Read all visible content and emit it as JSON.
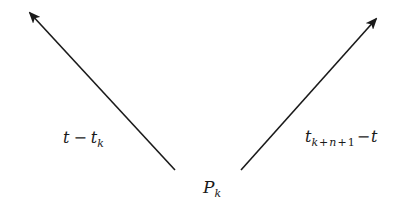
{
  "diagram": {
    "type": "vector-diagram",
    "colors": {
      "background": "#ffffff",
      "stroke": "#1a1a1a"
    },
    "arrows": [
      {
        "id": "left-arrow",
        "from": [
          175,
          170
        ],
        "to": [
          28,
          11
        ],
        "label": {
          "main": "t",
          "operator": "−",
          "second": "t",
          "second_sub": "k"
        }
      },
      {
        "id": "right-arrow",
        "from": [
          241,
          170
        ],
        "to": [
          378,
          17
        ],
        "label": {
          "main": "t",
          "main_sub_parts": [
            "k",
            "+",
            "n",
            "+",
            "1"
          ],
          "operator": "−",
          "second": "t"
        }
      }
    ],
    "point": {
      "name": "P",
      "sub": "k"
    }
  }
}
